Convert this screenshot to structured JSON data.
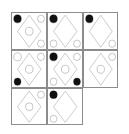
{
  "puzzle": {
    "kind": "matrix-reasoning",
    "rows": 3,
    "columns": 3,
    "border_color": "#8c8c8c",
    "shape_stroke_color": "#7a7a7a",
    "filled_color": "#111111",
    "open_color": "#ffffff",
    "background_color": "#ffffff",
    "base_shape": "diamond-outline",
    "marker_shape": "circle",
    "marker_positions": [
      "top-left",
      "top-right",
      "center",
      "bottom-left",
      "bottom-right"
    ],
    "cells": [
      {
        "id": "cell-r1c1",
        "row": 1,
        "column": 1,
        "label": "Row 1, Column 1",
        "blank": false,
        "diamond": true,
        "markers": {
          "top-left": "filled",
          "top-right": "open",
          "center": "open",
          "bottom-left": "none",
          "bottom-right": "open"
        }
      },
      {
        "id": "cell-r1c2",
        "row": 1,
        "column": 2,
        "label": "Row 1, Column 2",
        "blank": false,
        "diamond": true,
        "markers": {
          "top-left": "filled",
          "top-right": "none",
          "center": "none",
          "bottom-left": "open",
          "bottom-right": "open"
        }
      },
      {
        "id": "cell-r1c3",
        "row": 1,
        "column": 3,
        "label": "Row 1, Column 3",
        "blank": false,
        "diamond": true,
        "markers": {
          "top-left": "filled",
          "top-right": "none",
          "center": "none",
          "bottom-left": "none",
          "bottom-right": "open"
        }
      },
      {
        "id": "cell-r2c1",
        "row": 2,
        "column": 1,
        "label": "Row 2, Column 1",
        "blank": false,
        "diamond": true,
        "markers": {
          "top-left": "open",
          "top-right": "open",
          "center": "open",
          "bottom-left": "filled",
          "bottom-right": "none"
        }
      },
      {
        "id": "cell-r2c2",
        "row": 2,
        "column": 2,
        "label": "Row 2, Column 2",
        "blank": false,
        "diamond": true,
        "markers": {
          "top-left": "filled",
          "top-right": "open",
          "center": "open",
          "bottom-left": "open",
          "bottom-right": "filled"
        }
      },
      {
        "id": "cell-r2c3",
        "row": 2,
        "column": 3,
        "label": "Row 2, Column 3",
        "blank": false,
        "diamond": true,
        "markers": {
          "top-left": "none",
          "top-right": "open",
          "center": "open",
          "bottom-left": "none",
          "bottom-right": "none"
        }
      },
      {
        "id": "cell-r3c1",
        "row": 3,
        "column": 1,
        "label": "Row 3, Column 1",
        "blank": false,
        "diamond": true,
        "markers": {
          "top-left": "none",
          "top-right": "open",
          "center": "open",
          "bottom-left": "none",
          "bottom-right": "none"
        }
      },
      {
        "id": "cell-r3c2",
        "row": 3,
        "column": 2,
        "label": "Row 3, Column 2",
        "blank": false,
        "diamond": true,
        "markers": {
          "top-left": "filled",
          "top-right": "none",
          "center": "none",
          "bottom-left": "open",
          "bottom-right": "none"
        }
      },
      {
        "id": "cell-r3c3",
        "row": 3,
        "column": 3,
        "label": "Row 3, Column 3",
        "blank": true,
        "diamond": false,
        "markers": {
          "top-left": "none",
          "top-right": "none",
          "center": "none",
          "bottom-left": "none",
          "bottom-right": "none"
        }
      }
    ]
  }
}
